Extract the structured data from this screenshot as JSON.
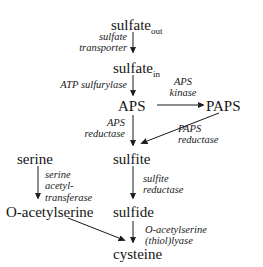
{
  "diagram": {
    "nodes": [
      {
        "id": "sulfate_out",
        "base": "sulfate",
        "sub": "out"
      },
      {
        "id": "sulfate_in",
        "base": "sulfate",
        "sub": "in"
      },
      {
        "id": "aps",
        "base": "APS",
        "sub": ""
      },
      {
        "id": "paps",
        "base": "PAPS",
        "sub": ""
      },
      {
        "id": "serine",
        "base": "serine",
        "sub": ""
      },
      {
        "id": "sulfite",
        "base": "sulfite",
        "sub": ""
      },
      {
        "id": "o_acetylserine",
        "base": "O-acetylserine",
        "sub": ""
      },
      {
        "id": "sulfide",
        "base": "sulfide",
        "sub": ""
      },
      {
        "id": "cysteine",
        "base": "cysteine",
        "sub": ""
      }
    ],
    "enzymes": [
      {
        "id": "sulfate_transporter",
        "line1": "sulfate",
        "line2": "transporter",
        "line3": ""
      },
      {
        "id": "atp_sulfurylase",
        "line1": "ATP sulfurylase",
        "line2": "",
        "line3": ""
      },
      {
        "id": "aps_kinase",
        "line1": "APS",
        "line2": "kinase",
        "line3": ""
      },
      {
        "id": "aps_reductase",
        "line1": "APS",
        "line2": "reductase",
        "line3": ""
      },
      {
        "id": "paps_reductase",
        "line1": "PAPS",
        "line2": "reductase",
        "line3": ""
      },
      {
        "id": "serine_acetyltransferase",
        "line1": "serine",
        "line2": "acetyl-",
        "line3": "transferase"
      },
      {
        "id": "sulfite_reductase",
        "line1": "sulfite",
        "line2": "reductase",
        "line3": ""
      },
      {
        "id": "oas_thiol_lyase",
        "line1": "O-acetylserine",
        "line2": "(thiol)lyase",
        "line3": ""
      }
    ],
    "colors": {
      "ink": "#141414",
      "background": "#ffffff"
    }
  }
}
